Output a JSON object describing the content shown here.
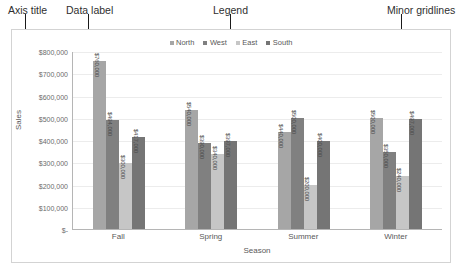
{
  "annotations": [
    {
      "label": "Axis title",
      "label_left": 8,
      "label_top": 4,
      "line_left": 25,
      "line_top": 14,
      "line_height": 52
    },
    {
      "label": "Data label",
      "label_left": 66,
      "label_top": 4,
      "line_left": 88,
      "line_top": 14,
      "line_height": 52
    },
    {
      "label": "Legend",
      "label_left": 213,
      "label_top": 4,
      "line_left": 230,
      "line_top": 14,
      "line_height": 24
    },
    {
      "label": "Minor gridlines",
      "label_left": 387,
      "label_top": 4,
      "line_left": 401,
      "line_top": 14,
      "line_height": 52
    }
  ],
  "chart_data": {
    "type": "bar",
    "title": "",
    "xlabel": "Season",
    "ylabel": "Sales",
    "ylim": [
      0,
      800000
    ],
    "ytick_step": 100000,
    "ytick_labels": [
      "$800,000",
      "$700,000",
      "$600,000",
      "$500,000",
      "$400,000",
      "$300,000",
      "$200,000",
      "$100,000",
      "$-"
    ],
    "ytick_values": [
      800000,
      700000,
      600000,
      500000,
      400000,
      300000,
      200000,
      100000,
      0
    ],
    "grid": true,
    "legend_position": "top",
    "categories": [
      "Fall",
      "Spring",
      "Summer",
      "Winter"
    ],
    "series": [
      {
        "name": "North",
        "color": "#a6a6a6",
        "values": [
          760000,
          540000,
          440000,
          500000
        ],
        "labels": [
          "$760,000",
          "$540,000",
          "$440,000",
          "$500,000"
        ]
      },
      {
        "name": "West",
        "color": "#808080",
        "values": [
          494000,
          390000,
          500000,
          350000
        ],
        "labels": [
          "$494,000",
          "$390,000",
          "$500,000",
          "$350,000"
        ]
      },
      {
        "name": "East",
        "color": "#c6c6c6",
        "values": [
          300000,
          340000,
          200000,
          240000
        ],
        "labels": [
          "$300,000",
          "$340,000",
          "$200,000",
          "$240,000"
        ]
      },
      {
        "name": "South",
        "color": "#757575",
        "values": [
          417000,
          397000,
          400000,
          497000
        ],
        "labels": [
          "$417,000",
          "$397,000",
          "$400,000",
          "$497,000"
        ]
      }
    ]
  }
}
